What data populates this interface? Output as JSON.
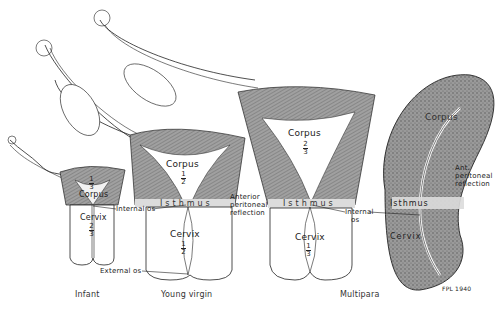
{
  "figure": {
    "panels": [
      {
        "caption": "Infant",
        "corpus_label": "Corpus",
        "corpus_fraction": {
          "num": "1",
          "den": "3"
        },
        "cervix_label": "Cervix",
        "cervix_fraction": {
          "num": "2",
          "den": "3"
        }
      },
      {
        "caption": "Young virgin",
        "corpus_label": "Corpus",
        "corpus_fraction": {
          "num": "1",
          "den": "2"
        },
        "isthmus_label": "Isthmus",
        "cervix_label": "Cervix",
        "cervix_fraction": {
          "num": "1",
          "den": "2"
        }
      },
      {
        "caption": "Multipara",
        "corpus_label": "Corpus",
        "corpus_fraction": {
          "num": "2",
          "den": "3"
        },
        "isthmus_label": "Isthmus",
        "cervix_label": "Cervix",
        "cervix_fraction": {
          "num": "1",
          "den": "3"
        }
      },
      {
        "caption": "",
        "corpus_label": "Corpus",
        "isthmus_label": "Isthmus",
        "cervix_label": "Cervix"
      }
    ],
    "annotations": {
      "internal_os_1": "Internal os",
      "external_os": "External os",
      "anterior_peritoneal_reflection": [
        "Anterior",
        "peritoneal",
        "reflection"
      ],
      "internal_os_2": [
        "Internal",
        "os"
      ],
      "ant_peritoneal_reflection": [
        "Ant.",
        "peritoneal",
        "reflection"
      ]
    },
    "signature": "FPL 1940"
  },
  "colors": {
    "ink": "#222222",
    "shading": "#8c8c8c",
    "isthmus_band": "#dcdcdc",
    "background": "#ffffff"
  }
}
